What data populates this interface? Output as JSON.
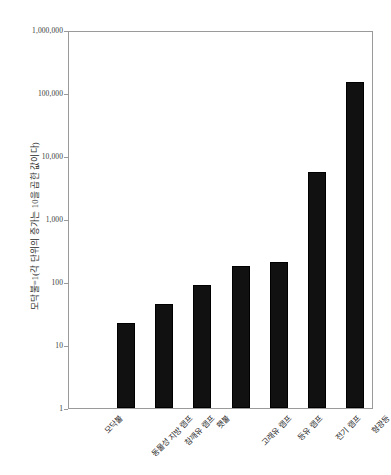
{
  "chart_data": {
    "type": "bar",
    "title": "",
    "subtitle": "",
    "xlabel": "",
    "ylabel": "모닥불=1(각 단위의 증가는 10을 곱한 값이다)",
    "scale": "log10",
    "ylim": [
      1,
      1000000
    ],
    "grid": false,
    "legend": null,
    "bar_color": "#111111",
    "axis_color": "#9a9a9a",
    "categories": [
      "모닥불",
      "동물성 지방 램프",
      "참깨유 램프",
      "횃불",
      "고래유 램프",
      "등유 램프",
      "전기 램프",
      "형광등"
    ],
    "values": [
      1,
      22,
      45,
      90,
      180,
      210,
      5500,
      150000
    ],
    "ytick_labels": [
      "1",
      "10",
      "100",
      "1,000",
      "10,000",
      "100,000",
      "1,000,000"
    ],
    "ytick_values": [
      1,
      10,
      100,
      1000,
      10000,
      100000,
      1000000
    ]
  }
}
